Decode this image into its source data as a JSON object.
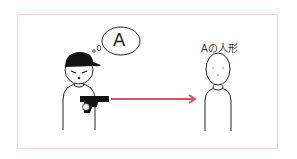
{
  "illustration": {
    "thought_bubble_letter": "A",
    "target_label": "Aの人形",
    "colors": {
      "arrow": "#d9546a",
      "frame": "#f0d4d6",
      "ink": "#222222"
    }
  }
}
